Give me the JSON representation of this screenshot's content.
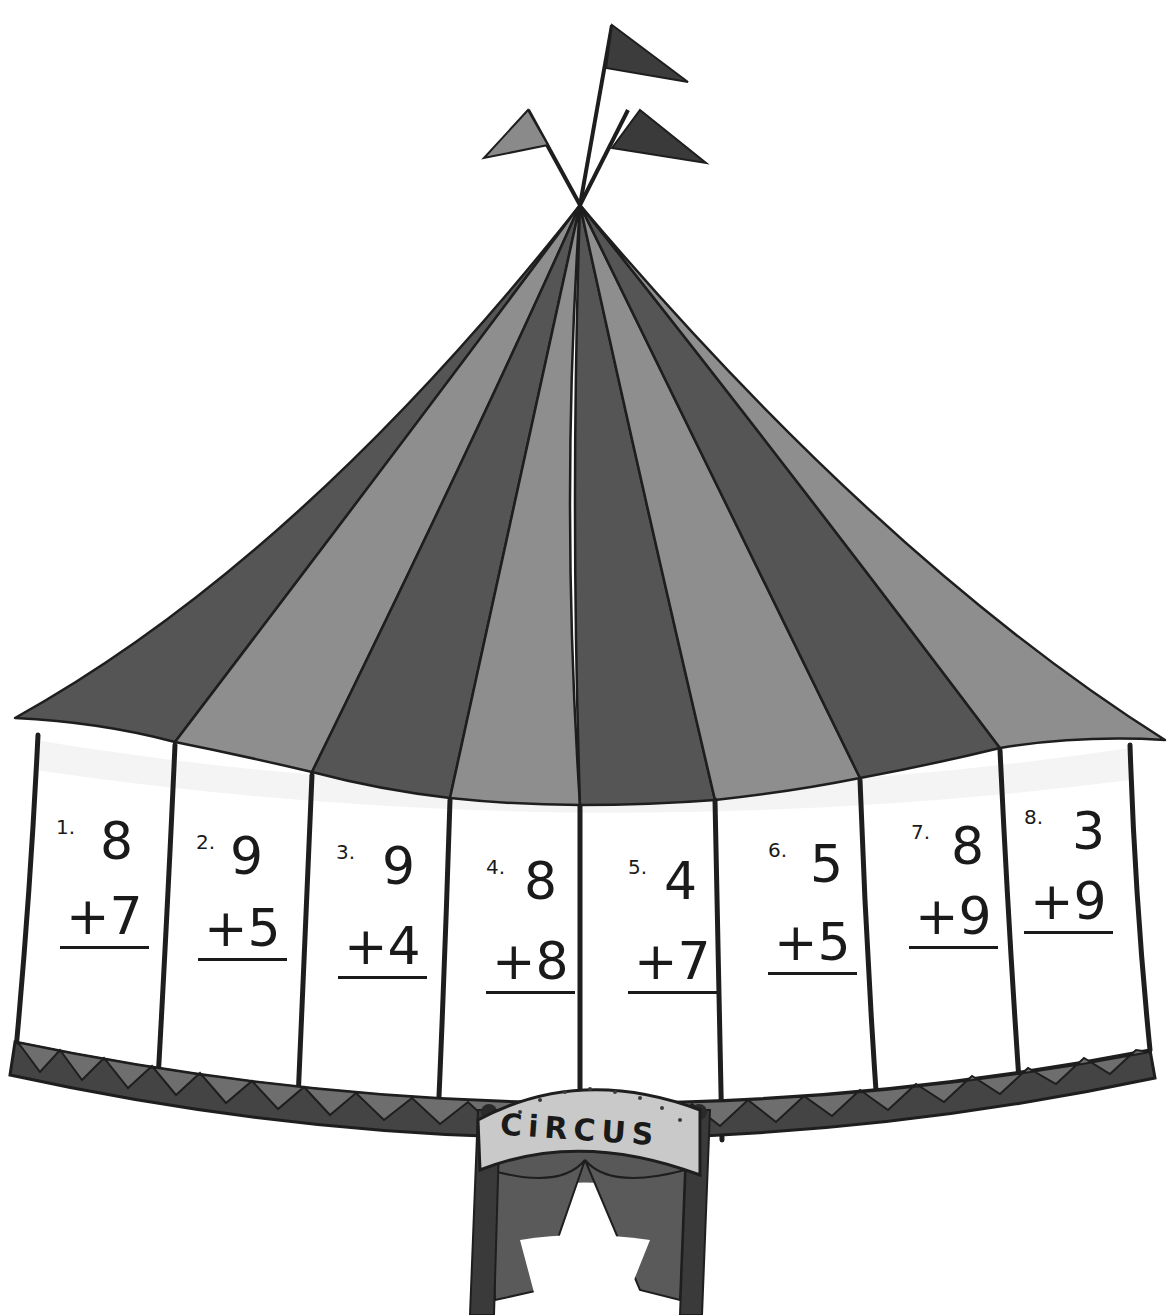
{
  "worksheet": {
    "illustration": "circus-tent",
    "sign_text": "CiRCUS",
    "problems": [
      {
        "number": "1.",
        "addend_top": "8",
        "addend_bottom": "+7"
      },
      {
        "number": "2.",
        "addend_top": "9",
        "addend_bottom": "+5"
      },
      {
        "number": "3.",
        "addend_top": "9",
        "addend_bottom": "+4"
      },
      {
        "number": "4.",
        "addend_top": "8",
        "addend_bottom": "+8"
      },
      {
        "number": "5.",
        "addend_top": "4",
        "addend_bottom": "+7"
      },
      {
        "number": "6.",
        "addend_top": "5",
        "addend_bottom": "+5"
      },
      {
        "number": "7.",
        "addend_top": "8",
        "addend_bottom": "+9"
      },
      {
        "number": "8.",
        "addend_top": "3",
        "addend_bottom": "+9"
      }
    ]
  },
  "colors": {
    "stripe_dark": "#555555",
    "stripe_light": "#8e8e8e",
    "outline": "#1e1e1e",
    "panel": "#ffffff",
    "trim": "#4a4a4a",
    "sign": "#c9c9c9"
  }
}
